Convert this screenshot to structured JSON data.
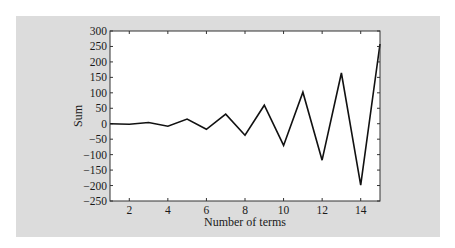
{
  "chart_data": {
    "type": "line",
    "title": "",
    "xlabel": "Number of terms",
    "ylabel": "Sum",
    "xlim": [
      1,
      15
    ],
    "ylim": [
      -250,
      300
    ],
    "x_ticks": [
      2,
      4,
      6,
      8,
      10,
      12,
      14
    ],
    "y_ticks": [
      -250,
      -200,
      -150,
      -100,
      -50,
      0,
      50,
      100,
      150,
      200,
      250,
      300
    ],
    "grid": false,
    "legend": null,
    "series": [
      {
        "name": "Sum",
        "color": "#111111",
        "x": [
          1,
          2,
          3,
          4,
          5,
          6,
          7,
          8,
          9,
          10,
          11,
          12,
          13,
          14,
          15
        ],
        "values": [
          0,
          -2,
          4,
          -8,
          15,
          -18,
          31,
          -37,
          60,
          -70,
          102,
          -118,
          164,
          -199,
          258
        ]
      }
    ]
  },
  "colors": {
    "panel_background": "#dcdcdc",
    "plot_background": "#ffffff",
    "line": "#111111",
    "axis": "#333333"
  }
}
